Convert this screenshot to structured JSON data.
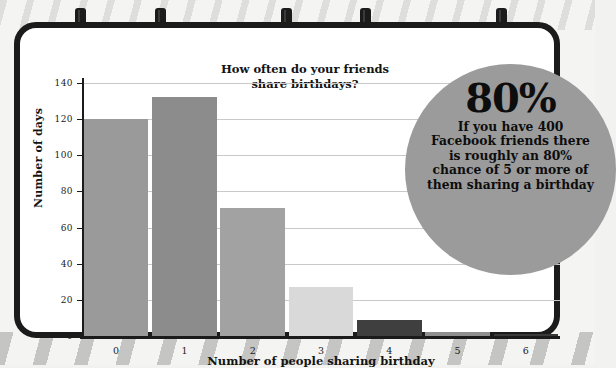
{
  "chart_data": {
    "type": "bar",
    "title": "How often do your friends share birthdays?",
    "title_line1": "How often do your friends",
    "title_line2": "share birthdays?",
    "xlabel": "Number of people sharing birthday",
    "ylabel": "Number of days",
    "categories": [
      "0",
      "1",
      "2",
      "3",
      "4",
      "5",
      "6"
    ],
    "values": [
      120,
      132,
      71,
      27,
      9,
      2,
      0.5
    ],
    "bar_colors": [
      "#9a9a9a",
      "#8c8c8c",
      "#a2a2a2",
      "#d9d9d9",
      "#3f3f3f",
      "#8f8f8f",
      "#3a3a3a"
    ],
    "ylim": [
      0,
      140
    ],
    "xlim": [
      -0.5,
      6.5
    ],
    "y_ticks": [
      0,
      20,
      40,
      60,
      80,
      100,
      120,
      140
    ],
    "y_tick_labels": [
      "0",
      "20",
      "40",
      "60",
      "80",
      "100",
      "120",
      "140"
    ],
    "grid": true,
    "grid_color": "#c9c9c9",
    "legend": "none",
    "axis_color": "#1b1b1b"
  },
  "callout": {
    "headline": "80%",
    "body": "If you have 400 Facebook friends there is roughly an 80% chance of 5 or more of them sharing a birthday",
    "background_color": "#9b9b9b",
    "text_color": "#0d0d0d"
  },
  "board": {
    "frame_color": "#1b1b1b",
    "surface_color": "#ffffff",
    "clip_count": 5
  }
}
